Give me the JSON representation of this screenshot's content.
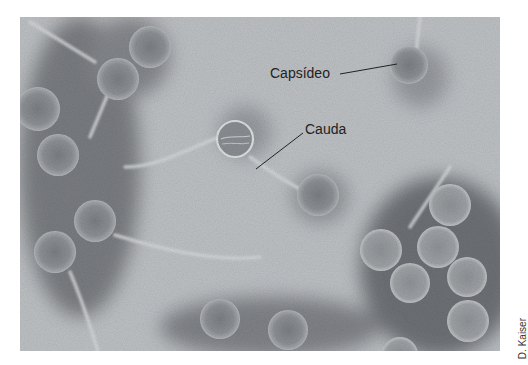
{
  "figure": {
    "labels": {
      "capsid": "Capsídeo",
      "tail": "Cauda"
    },
    "credit": "D. Kaiser"
  },
  "colors": {
    "background_light": "#c4c7ca",
    "background_mid": "#a9acaf",
    "stain_dark": "#55585c",
    "capsid_fill": "#8a8d91",
    "capsid_rim": "#c9cbce",
    "label_text": "#222222"
  }
}
